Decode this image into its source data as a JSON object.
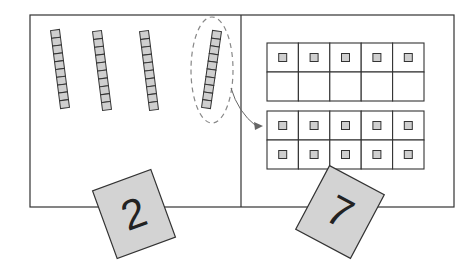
{
  "diagram": {
    "left_panel": {
      "label": "tens",
      "rods": 4,
      "cubes_per_rod": 10,
      "highlighted_rod_index": 3,
      "card_digit": "2"
    },
    "right_panel": {
      "label": "ones",
      "ten_frames": [
        {
          "rows": 2,
          "cols": 5,
          "filled": 5
        },
        {
          "rows": 2,
          "cols": 5,
          "filled": 10
        }
      ],
      "card_digit": "7"
    },
    "arrow": {
      "from": "highlighted-rod",
      "to": "second-ten-frame"
    }
  },
  "colors": {
    "line": "#333333",
    "cube_fill": "#cfcfcf",
    "card_fill": "#d3d3d3",
    "dashed": "#888888"
  }
}
